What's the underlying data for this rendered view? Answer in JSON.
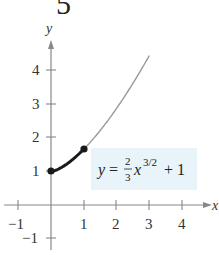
{
  "figure_number": "5",
  "chart_data": {
    "type": "line",
    "title": "",
    "xlabel": "x",
    "ylabel": "y",
    "xlim": [
      -1.3,
      4.8
    ],
    "ylim": [
      -1.3,
      4.9
    ],
    "x_ticks": [
      -1,
      1,
      2,
      3,
      4
    ],
    "y_ticks": [
      -1,
      1,
      2,
      3,
      4
    ],
    "x_tick_labels": [
      "−1",
      "1",
      "2",
      "3",
      "4"
    ],
    "y_tick_labels": [
      "−1",
      "1",
      "2",
      "3",
      "4"
    ],
    "grid": false,
    "series": [
      {
        "name": "y = (2/3)x^(3/2) + 1",
        "style": "thin gray",
        "x": [
          0,
          0.5,
          1,
          1.5,
          2,
          2.5,
          3
        ],
        "values": [
          1,
          1.236,
          1.667,
          2.225,
          2.886,
          3.635,
          4.464
        ]
      },
      {
        "name": "arc length segment",
        "style": "bold black",
        "x": [
          0,
          0.25,
          0.5,
          0.75,
          1
        ],
        "values": [
          1,
          1.083,
          1.236,
          1.433,
          1.667
        ]
      }
    ],
    "points": [
      {
        "x": 0,
        "y": 1
      },
      {
        "x": 1,
        "y": 1.667
      }
    ],
    "annotation": {
      "text": "y = (2/3)x^(3/2) + 1",
      "lhs": "y",
      "eq": "=",
      "num": "2",
      "den": "3",
      "var": "x",
      "exp": "3/2",
      "tail": "+ 1",
      "background": "#e8f4f9"
    }
  },
  "colors": {
    "axis": "#888888",
    "curve": "#9a9a9a",
    "bold_curve": "#1a1a1a",
    "point": "#1a1a1a"
  }
}
